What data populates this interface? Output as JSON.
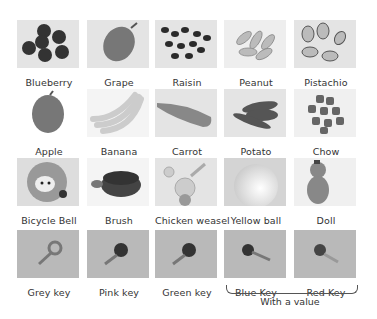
{
  "grid": {
    "rows": [
      {
        "items": [
          {
            "label": "Blueberry",
            "icon": "blueberry-icon"
          },
          {
            "label": "Grape",
            "icon": "grape-icon"
          },
          {
            "label": "Raisin",
            "icon": "raisin-icon"
          },
          {
            "label": "Peanut",
            "icon": "peanut-icon"
          },
          {
            "label": "Pistachio",
            "icon": "pistachio-icon"
          }
        ]
      },
      {
        "items": [
          {
            "label": "Apple",
            "icon": "apple-icon"
          },
          {
            "label": "Banana",
            "icon": "banana-icon"
          },
          {
            "label": "Carrot",
            "icon": "carrot-icon"
          },
          {
            "label": "Potato",
            "icon": "potato-icon"
          },
          {
            "label": "Chow",
            "icon": "chow-icon"
          }
        ]
      },
      {
        "items": [
          {
            "label": "Bicycle Bell",
            "icon": "bicycle-bell-icon"
          },
          {
            "label": "Brush",
            "icon": "brush-icon"
          },
          {
            "label": "Chicken weasel",
            "icon": "chicken-weasel-icon"
          },
          {
            "label": "Yellow ball",
            "icon": "yellow-ball-icon"
          },
          {
            "label": "Doll",
            "icon": "doll-icon"
          }
        ]
      },
      {
        "items": [
          {
            "label": "Grey key",
            "icon": "key-icon"
          },
          {
            "label": "Pink key",
            "icon": "key-icon"
          },
          {
            "label": "Green key",
            "icon": "key-icon"
          },
          {
            "label": "Blue Key",
            "icon": "key-icon"
          },
          {
            "label": "Red Key",
            "icon": "key-icon"
          }
        ]
      }
    ]
  },
  "annotation": {
    "caption": "With a value",
    "spans": [
      "Blue Key",
      "Red Key"
    ]
  }
}
